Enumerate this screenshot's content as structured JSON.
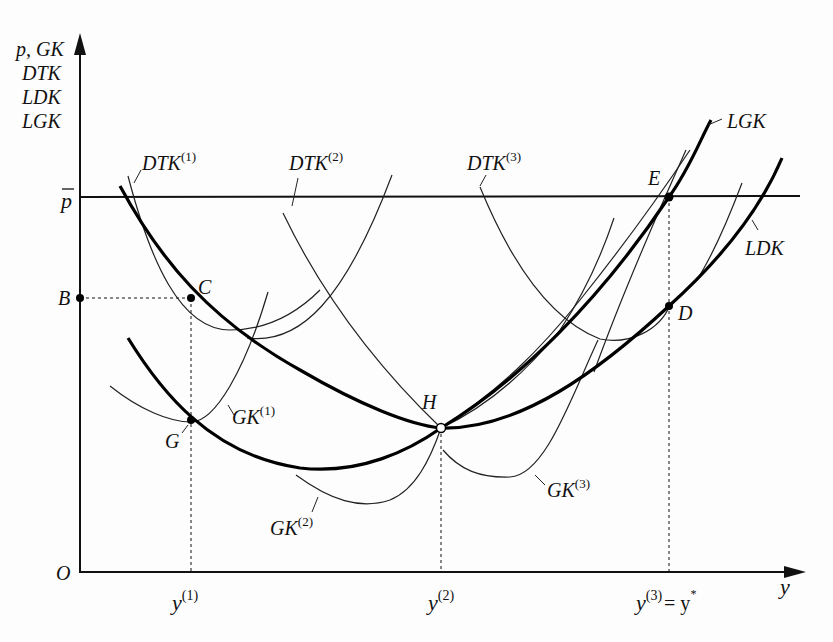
{
  "diagram": {
    "type": "cost-curves",
    "y_axis": {
      "label_lines": [
        "p, GK",
        "DTK",
        "LDK",
        "LGK"
      ]
    },
    "x_axis": {
      "label": "y",
      "origin_label": "O",
      "ticks": [
        {
          "base": "y",
          "sup": "(1)",
          "suffix": ""
        },
        {
          "base": "y",
          "sup": "(2)",
          "suffix": ""
        },
        {
          "base": "y",
          "sup": "(3)",
          "suffix": "= y",
          "suffix_sup": "*"
        }
      ]
    },
    "price_line": {
      "label": "p",
      "overline": true
    },
    "points": [
      {
        "id": "B",
        "label": "B"
      },
      {
        "id": "C",
        "label": "C"
      },
      {
        "id": "G",
        "label": "G"
      },
      {
        "id": "H",
        "label": "H"
      },
      {
        "id": "E",
        "label": "E"
      },
      {
        "id": "D",
        "label": "D"
      }
    ],
    "curves": {
      "dtk1": {
        "base": "DTK",
        "sup": "(1)"
      },
      "dtk2": {
        "base": "DTK",
        "sup": "(2)"
      },
      "dtk3": {
        "base": "DTK",
        "sup": "(3)"
      },
      "gk1": {
        "base": "GK",
        "sup": "(1)"
      },
      "gk2": {
        "base": "GK",
        "sup": "(2)"
      },
      "gk3": {
        "base": "GK",
        "sup": "(3)"
      },
      "lgk": {
        "base": "LGK"
      },
      "ldk": {
        "base": "LDK"
      }
    }
  }
}
